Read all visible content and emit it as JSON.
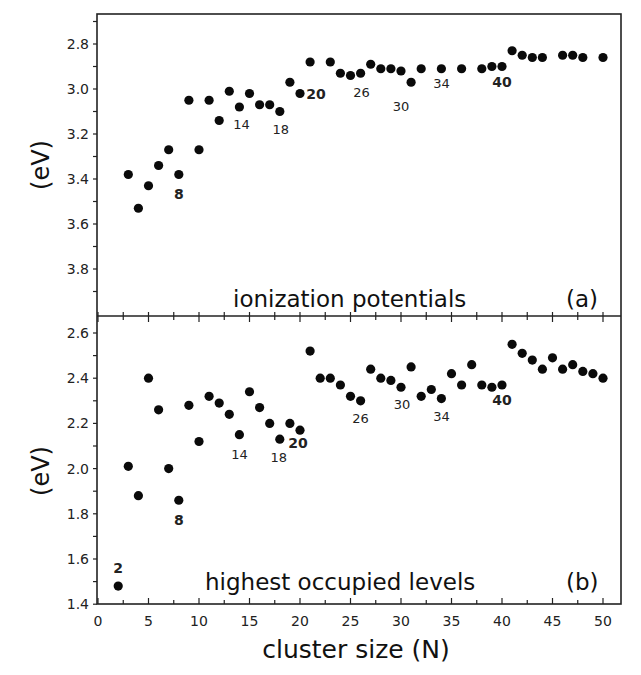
{
  "chart_data": [
    {
      "type": "scatter",
      "panel": "(a)",
      "title": "ionization potentials",
      "xlabel": "cluster size (N)",
      "ylabel": "(eV)",
      "xlim": [
        0,
        50
      ],
      "ylim": [
        4.0,
        2.67
      ],
      "y_inverted": true,
      "yticks": [
        "2.8",
        "3.0",
        "3.2",
        "3.4",
        "3.6",
        "3.8"
      ],
      "grid": false,
      "legend": null,
      "series": [
        {
          "name": "ionization potentials",
          "x": [
            3,
            4,
            5,
            6,
            7,
            8,
            9,
            10,
            11,
            12,
            13,
            14,
            15,
            16,
            17,
            18,
            19,
            20,
            21,
            23,
            24,
            25,
            26,
            27,
            28,
            29,
            30,
            31,
            32,
            34,
            36,
            38,
            39,
            40,
            41,
            42,
            43,
            44,
            46,
            47,
            48,
            50
          ],
          "y": [
            3.38,
            3.53,
            3.43,
            3.34,
            3.27,
            3.38,
            3.05,
            3.27,
            3.05,
            3.14,
            3.01,
            3.08,
            3.02,
            3.07,
            3.07,
            3.1,
            2.97,
            3.02,
            2.88,
            2.88,
            2.93,
            2.94,
            2.93,
            2.89,
            2.91,
            2.91,
            2.92,
            2.97,
            2.91,
            2.91,
            2.91,
            2.91,
            2.9,
            2.9,
            2.83,
            2.85,
            2.86,
            2.86,
            2.85,
            2.85,
            2.86,
            2.86
          ]
        }
      ],
      "annotations": [
        {
          "text": "8",
          "x": 8,
          "bold": true
        },
        {
          "text": "14",
          "x": 14,
          "bold": false
        },
        {
          "text": "18",
          "x": 18,
          "bold": false
        },
        {
          "text": "20",
          "x": 20,
          "bold": true
        },
        {
          "text": "26",
          "x": 26,
          "bold": false
        },
        {
          "text": "30",
          "x": 30,
          "bold": false
        },
        {
          "text": "34",
          "x": 34,
          "bold": false
        },
        {
          "text": "40",
          "x": 40,
          "bold": true
        }
      ]
    },
    {
      "type": "scatter",
      "panel": "(b)",
      "title": "highest occupied levels",
      "xlabel": "cluster size (N)",
      "ylabel": "(eV)",
      "xlim": [
        0,
        50
      ],
      "ylim": [
        1.4,
        2.67
      ],
      "xticks": [
        "0",
        "5",
        "10",
        "15",
        "20",
        "25",
        "30",
        "35",
        "40",
        "45",
        "50"
      ],
      "yticks": [
        "1.4",
        "1.6",
        "1.8",
        "2.0",
        "2.2",
        "2.4",
        "2.6"
      ],
      "grid": false,
      "legend": null,
      "series": [
        {
          "name": "highest occupied levels",
          "x": [
            2,
            3,
            4,
            5,
            6,
            7,
            8,
            9,
            10,
            11,
            12,
            13,
            14,
            15,
            16,
            17,
            18,
            19,
            20,
            21,
            22,
            23,
            24,
            25,
            26,
            27,
            28,
            29,
            30,
            31,
            32,
            33,
            34,
            35,
            36,
            37,
            38,
            39,
            40,
            41,
            42,
            43,
            44,
            45,
            46,
            47,
            48,
            49,
            50
          ],
          "y": [
            1.48,
            2.01,
            1.88,
            2.4,
            2.26,
            2.0,
            1.86,
            2.28,
            2.12,
            2.32,
            2.29,
            2.24,
            2.15,
            2.34,
            2.27,
            2.2,
            2.13,
            2.2,
            2.17,
            2.52,
            2.4,
            2.4,
            2.37,
            2.32,
            2.3,
            2.44,
            2.4,
            2.39,
            2.36,
            2.45,
            2.32,
            2.35,
            2.31,
            2.42,
            2.37,
            2.46,
            2.37,
            2.36,
            2.37,
            2.55,
            2.51,
            2.48,
            2.44,
            2.49,
            2.44,
            2.46,
            2.43,
            2.42,
            2.4
          ]
        }
      ],
      "annotations": [
        {
          "text": "2",
          "x": 2,
          "bold": true
        },
        {
          "text": "8",
          "x": 8,
          "bold": true
        },
        {
          "text": "14",
          "x": 14,
          "bold": false
        },
        {
          "text": "18",
          "x": 18,
          "bold": false
        },
        {
          "text": "20",
          "x": 20,
          "bold": true
        },
        {
          "text": "26",
          "x": 26,
          "bold": false
        },
        {
          "text": "30",
          "x": 30,
          "bold": false
        },
        {
          "text": "34",
          "x": 34,
          "bold": false
        },
        {
          "text": "40",
          "x": 40,
          "bold": true
        }
      ]
    }
  ],
  "labels": {
    "panel_a_title": "ionization potentials",
    "panel_a_tag": "(a)",
    "panel_b_title": "highest occupied levels",
    "panel_b_tag": "(b)",
    "ylabel_a": "(eV)",
    "ylabel_b": "(eV)",
    "xlabel": "cluster size (N)"
  },
  "colors": {
    "marker": "#0a0a0a",
    "axis": "#222222",
    "background": "#ffffff"
  }
}
